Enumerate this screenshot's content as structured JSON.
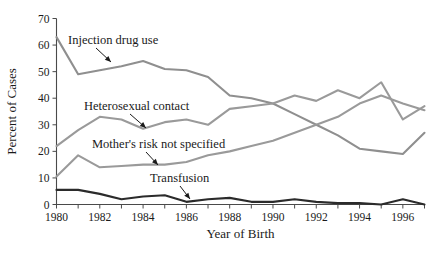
{
  "chart_data": {
    "type": "line",
    "title": "",
    "xlabel": "Year of Birth",
    "ylabel": "Percent of Cases",
    "x": [
      1980,
      1981,
      1982,
      1983,
      1984,
      1985,
      1986,
      1987,
      1988,
      1989,
      1990,
      1991,
      1992,
      1993,
      1994,
      1995,
      1996,
      1997
    ],
    "xlim": [
      1980,
      1997
    ],
    "ylim": [
      0,
      70
    ],
    "xticks": [
      1980,
      1982,
      1984,
      1986,
      1988,
      1990,
      1992,
      1994,
      1996
    ],
    "xtick_labels": [
      "1980",
      "1982",
      "1984",
      "1986",
      "1988",
      "1990",
      "1992",
      "1994",
      "1996"
    ],
    "xticks_minor": [
      1981,
      1983,
      1985,
      1987,
      1989,
      1991,
      1993,
      1995,
      1997
    ],
    "yticks": [
      0,
      10,
      20,
      30,
      40,
      50,
      60,
      70
    ],
    "ytick_labels": [
      "0",
      "10",
      "20",
      "30",
      "40",
      "50",
      "60",
      "70"
    ],
    "grid": false,
    "legend_position": "inline-annotations",
    "series": [
      {
        "name": "Injection drug use",
        "color": "#8f8f8f",
        "values": [
          63,
          49,
          50.5,
          52,
          54,
          51,
          50.5,
          48,
          41,
          40,
          38,
          34,
          30,
          26,
          21,
          20,
          19,
          27
        ]
      },
      {
        "name": "Heterosexual contact",
        "color": "#9a9a9a",
        "values": [
          22,
          28,
          33,
          32,
          28.5,
          31,
          32,
          30,
          36,
          37,
          38,
          41,
          39,
          43,
          40,
          46,
          32,
          37
        ]
      },
      {
        "name": "Mother's risk not specified",
        "color": "#9a9a9a",
        "values": [
          10.5,
          18.5,
          14,
          14.5,
          15,
          15,
          16,
          18.5,
          20,
          22,
          24,
          27,
          30,
          33,
          38,
          41,
          38,
          35.5
        ]
      },
      {
        "name": "Transfusion",
        "color": "#2b2b2b",
        "values": [
          5.5,
          5.5,
          4,
          2,
          3,
          3.5,
          1,
          2,
          2.5,
          1,
          1,
          2,
          1,
          0.5,
          0.5,
          0,
          2,
          0
        ]
      }
    ],
    "annotations": [
      {
        "text": "Injection drug use",
        "series": "Injection drug use"
      },
      {
        "text": "Heterosexual contact",
        "series": "Heterosexual contact"
      },
      {
        "text": "Mother's risk not specified",
        "series": "Mother's risk not specified"
      },
      {
        "text": "Transfusion",
        "series": "Transfusion"
      }
    ]
  }
}
